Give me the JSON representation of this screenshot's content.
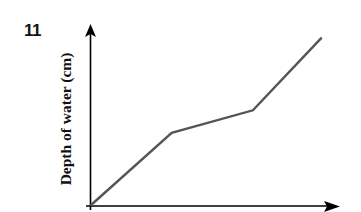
{
  "question_number": "11",
  "chart_data": {
    "type": "line",
    "title": "",
    "xlabel": "",
    "ylabel": "Depth of water (cm)",
    "x_ticks": [],
    "y_ticks": [],
    "grid": false,
    "legend": null,
    "series": [
      {
        "name": "depth",
        "color": "#555555",
        "points": [
          {
            "x": 0,
            "y": 0
          },
          {
            "x": 0.33,
            "y": 0.42
          },
          {
            "x": 0.66,
            "y": 0.55
          },
          {
            "x": 0.94,
            "y": 0.97
          }
        ]
      }
    ]
  },
  "style": {
    "axis_color": "#000000",
    "line_color": "#555555"
  }
}
